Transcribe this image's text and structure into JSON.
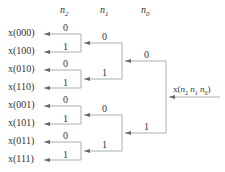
{
  "headers": {
    "n2": "n",
    "n2_sub": "2",
    "n1": "n",
    "n1_sub": "1",
    "n0": "n",
    "n0_sub": "0"
  },
  "input_label": {
    "prefix": "x(",
    "n2": "n",
    "n2_sub": "2",
    "n1": "n",
    "n1_sub": "1",
    "n0": "n",
    "n0_sub": "0",
    "suffix": ")"
  },
  "outputs": [
    "x(000)",
    "x(100)",
    "x(010)",
    "x(110)",
    "x(001)",
    "x(101)",
    "x(011)",
    "x(111)"
  ],
  "stage1_labels": [
    "0",
    "1",
    "0",
    "1",
    "0",
    "1",
    "0",
    "1"
  ],
  "stage2_labels": [
    "0",
    "1",
    "0",
    "1"
  ],
  "stage3_labels": [
    "0",
    "1"
  ],
  "colors": {
    "line": "#999999",
    "text": "#333333",
    "arrow": "#666666"
  }
}
